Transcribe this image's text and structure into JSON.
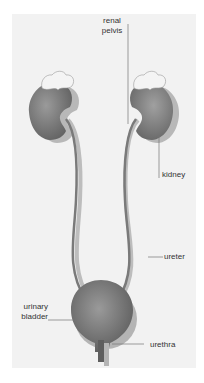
{
  "diagram": {
    "type": "anatomy",
    "labels": {
      "renal_pelvis_line1": "renal",
      "renal_pelvis_line2": "pelvis",
      "kidney": "kidney",
      "ureter": "ureter",
      "urinary_bladder_line1": "urinary",
      "urinary_bladder_line2": "bladder",
      "urethra": "urethra"
    },
    "colors": {
      "background": "#f2f2f2",
      "organ_dark": "#6e6e6e",
      "organ_mid": "#8c8c8c",
      "organ_light": "#b4b4b4",
      "adrenal": "#f4f4f4",
      "leader_line": "#777777",
      "text": "#333333"
    }
  }
}
